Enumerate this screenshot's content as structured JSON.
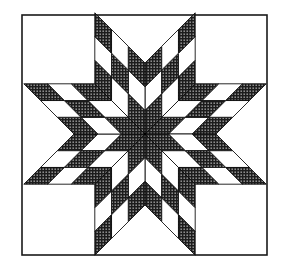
{
  "figure": {
    "canvas": {
      "width": 283,
      "height": 267,
      "background": "#ffffff"
    },
    "frame": {
      "x": 22,
      "y": 15,
      "width": 245,
      "height": 240,
      "stroke": "#1a1a1a",
      "stroke_width": 1.6
    },
    "star": {
      "center": [
        145,
        134
      ],
      "points": 8,
      "rhombus_side": 71,
      "grid": 3,
      "shading_rule": "cell shaded when (row + column) is even",
      "colors": {
        "shaded_base": "#1c1c1c",
        "shaded_dot": "#ffffff",
        "light": "#ffffff",
        "line": "#111111"
      },
      "line_width": 0.9
    }
  }
}
